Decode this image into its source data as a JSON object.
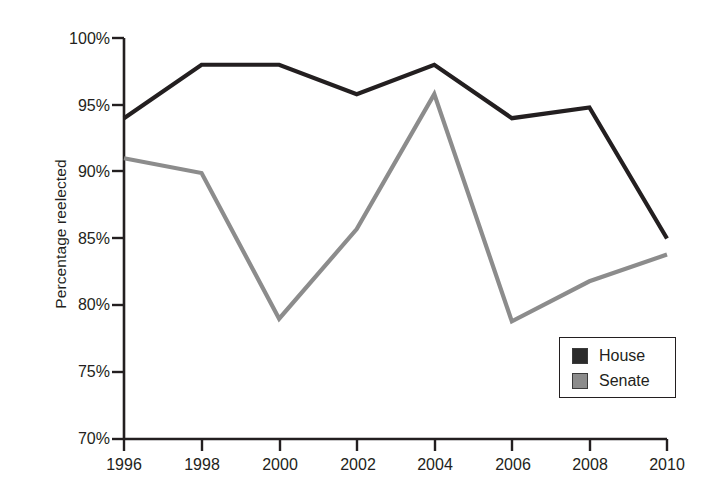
{
  "chart_data": {
    "type": "line",
    "title": "",
    "xlabel": "",
    "ylabel": "Percentage reelected",
    "x": [
      1996,
      1998,
      2000,
      2002,
      2004,
      2006,
      2008,
      2010
    ],
    "xticklabels": [
      "1996",
      "1998",
      "2000",
      "2002",
      "2004",
      "2006",
      "2008",
      "2010"
    ],
    "yticklabels": [
      "70%",
      "75%",
      "80%",
      "85%",
      "90%",
      "95%",
      "100%"
    ],
    "yticks": [
      70,
      75,
      80,
      85,
      90,
      95,
      100
    ],
    "ylim": [
      70,
      100
    ],
    "xlim": [
      1996,
      2010
    ],
    "grid": false,
    "legend_position": "bottom-right",
    "series": [
      {
        "name": "House",
        "color": "#231f20",
        "values": [
          94.0,
          98.0,
          98.0,
          95.8,
          98.0,
          94.0,
          94.8,
          85.0
        ]
      },
      {
        "name": "Senate",
        "color": "#8c8c8c",
        "values": [
          91.0,
          89.9,
          79.0,
          85.7,
          95.8,
          78.8,
          81.8,
          83.8
        ]
      }
    ]
  },
  "legend": {
    "items": [
      {
        "label": "House",
        "color": "#2b2b2b"
      },
      {
        "label": "Senate",
        "color": "#8c8c8c"
      }
    ]
  },
  "axes": {
    "y_label": "Percentage reelected",
    "y_ticks": [
      "100%",
      "95%",
      "90%",
      "85%",
      "80%",
      "75%",
      "70%"
    ],
    "x_ticks": [
      "1996",
      "1998",
      "2000",
      "2002",
      "2004",
      "2006",
      "2008",
      "2010"
    ]
  }
}
